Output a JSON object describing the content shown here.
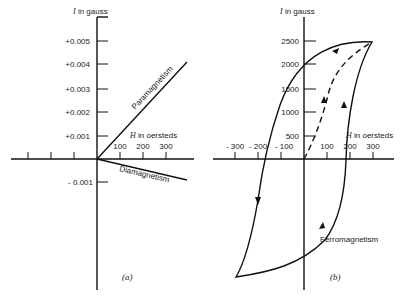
{
  "panel_a": {
    "y_axis_label_var": "I",
    "y_axis_label_unit": " in gauss",
    "x_axis_label_var": "H",
    "x_axis_label_unit": " in oersteds",
    "y_ticks": [
      "+0.005",
      "+0.004",
      "+0.003",
      "+0.002",
      "+0.001",
      "- 0.001"
    ],
    "x_ticks": [
      "100",
      "200",
      "300"
    ],
    "curve_labels": {
      "para": "Paramagnetism",
      "dia": "Diamagnetism"
    },
    "caption": "(a)"
  },
  "panel_b": {
    "y_axis_label_var": "I",
    "y_axis_label_unit": " in gauss",
    "x_axis_label_var": "H",
    "x_axis_label_unit": " in oersteds",
    "y_ticks": [
      "2500",
      "2000",
      "1500",
      "1000",
      "500"
    ],
    "x_ticks_neg": [
      "- 300",
      "- 200",
      "- 100"
    ],
    "x_ticks_pos": [
      "100",
      "200",
      "300"
    ],
    "curve_label": "Ferromagnetism",
    "caption": "(b)"
  }
}
